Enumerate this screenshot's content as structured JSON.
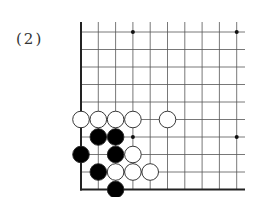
{
  "diagram": {
    "label": "(2)",
    "type": "go-board-corner",
    "grid": {
      "x0": 81,
      "y0": 32,
      "dx": 17.3,
      "dy": 17.5,
      "cols": 10,
      "rows": 10,
      "top_extend": 22,
      "right_extend": 245
    },
    "star_points": [
      [
        3,
        0
      ],
      [
        9,
        0
      ],
      [
        3,
        6
      ],
      [
        9,
        6
      ]
    ],
    "stones": [
      {
        "color": "white",
        "col": 0,
        "row": 5
      },
      {
        "color": "white",
        "col": 1,
        "row": 5
      },
      {
        "color": "white",
        "col": 2,
        "row": 5
      },
      {
        "color": "white",
        "col": 3,
        "row": 5
      },
      {
        "color": "white",
        "col": 5,
        "row": 5
      },
      {
        "color": "black",
        "col": 1,
        "row": 6
      },
      {
        "color": "black",
        "col": 2,
        "row": 6
      },
      {
        "color": "black",
        "col": 0,
        "row": 7
      },
      {
        "color": "black",
        "col": 2,
        "row": 7
      },
      {
        "color": "white",
        "col": 3,
        "row": 7
      },
      {
        "color": "black",
        "col": 1,
        "row": 8
      },
      {
        "color": "white",
        "col": 2,
        "row": 8
      },
      {
        "color": "white",
        "col": 3,
        "row": 8
      },
      {
        "color": "white",
        "col": 4,
        "row": 8
      },
      {
        "color": "black",
        "col": 2,
        "row": 9
      }
    ],
    "colors": {
      "line": "#555555",
      "edge": "#222222",
      "black": "#000000",
      "white": "#ffffff"
    }
  }
}
